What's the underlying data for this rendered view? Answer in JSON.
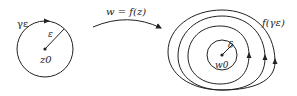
{
  "domain_circle": {
    "curve_label": "γε",
    "radius_label": "ε",
    "center_label": "z0"
  },
  "mapping": {
    "label": "w = f(z)"
  },
  "image_region": {
    "curve_label": "f(γε)",
    "radius_label": "δ",
    "center_label": "w0"
  },
  "colors": {
    "stroke": "#222222",
    "background": "#ffffff"
  }
}
